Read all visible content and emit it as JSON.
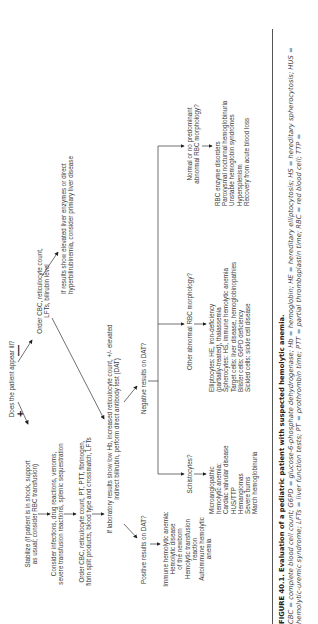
{
  "flowchart": {
    "start_question": "Does the patient appear ill?",
    "plus_sign": "+",
    "minus_sign": "—",
    "ill_branch": {
      "stabilize": "Stabilize (if patient is in shock, support\nas usual; consider RBC transfusion)",
      "consider": "Consider infections, drug reactions, venoms,\nsevere transfusion reactions, splenic sequestration",
      "order_labs": "Order CBC, reticulocyte count, PT, PTT, fibrinogen,\nfibrin split products, blood type and crossmatch, LFTs"
    },
    "not_ill_branch": {
      "order_labs": "Order CBC, reticulocyte count,\nLFTs, bilirubin level",
      "liver_note": "If results show elevated liver enzymes or direct\nhyperbilirubinemia, consider primary liver disease"
    },
    "lab_results": "If laboratory results show low Hb, increased reticulocyte count, +/- elevated\nindirect bilirubin, perform direct antibody test (DAT)",
    "positive_dat": {
      "question": "Positive results on DAT?",
      "result": "Immune hemolytic anemia:\nHemolytic disease\nof the newborn\nHemolytic transfusion\nreaction\nAutoimmune hemolytic\nanemia"
    },
    "negative_dat": {
      "question": "Negative results on DAT?",
      "schistocytes": {
        "question": "Schistocytes?",
        "result": "Microangiopathic\nhemolytic anemia:\nCardiac valvular disease\nHUS/TTP\nHemangiomas\nSevere burns\nMarch hemoglobinuria"
      },
      "other_abnormal": {
        "question": "Other abnormal RBC morphology?",
        "result": "Elliptocytes: HE, iron-deficiency\n(partially-treated), thalassemia\nSpherocytes: HS, immune hemolytic anemia\nTarget cells: liver disease, hemoglobinopathies\nBlister cells: G6PD deficiency\nSickled cells: sickle cell disease"
      },
      "normal": {
        "question": "Normal or no predominant\nabnormal RBC morphology?",
        "result": "RBC enzyme disorders\nParoxysmal nocturnal hemoglobinuria\nUnstable hemoglobin syndromes\nHypersplenism\nRecovery from acute blood loss"
      }
    }
  },
  "caption": {
    "figure_label": "FIGURE 40.1.",
    "title": "Evaluation of a pediatric patient with suspected hemolytic anemia.",
    "abbreviations": "CBC = complete blood cell count; G6PD = glucose-6-phosphate dehydrogenase; Hb = hemoglobin; HE = hereditary elliptocytosis; HS = hereditary spherocytosis; HUS = hemolytic-uremic syndrome; LFTs = liver function tests; PT = prothrombin time; PTT = partial thromboplastin time; RBC = red blood cell; TTP ="
  },
  "colors": {
    "text": "#3a3a3a",
    "lines": "#333333",
    "rule": "#555555"
  }
}
